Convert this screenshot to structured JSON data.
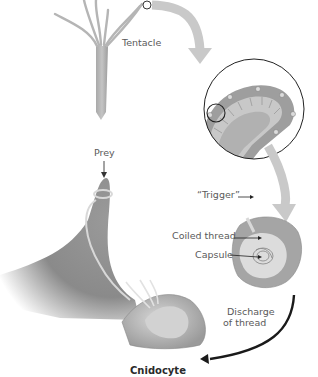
{
  "figure": {
    "title": "Cnidocyte",
    "labels": {
      "tentacle": "Tentacle",
      "prey": "Prey",
      "trigger": "“Trigger”",
      "coiled_thread": "Coiled thread",
      "capsule": "Capsule",
      "discharge_line1": "Discharge",
      "discharge_line2": "of thread"
    },
    "colors": {
      "body": "#b9b9b9",
      "body_dark": "#8f8f8f",
      "arrow_light": "#c9c9c9",
      "arrow_dark": "#1a1a1a",
      "outline": "#222222"
    }
  }
}
